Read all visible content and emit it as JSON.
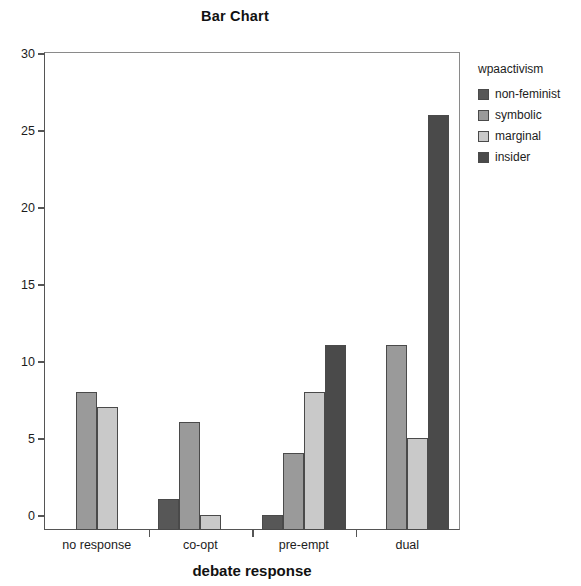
{
  "chart_data": {
    "type": "bar",
    "title": "Bar Chart",
    "xlabel": "debate response",
    "ylabel": "",
    "ylim": [
      0,
      31
    ],
    "grid": false,
    "legend_position": "right",
    "legend_title": "wpaactivism",
    "yticks": [
      0,
      5,
      10,
      15,
      20,
      25,
      30
    ],
    "ytick_labels": [
      "0",
      "5",
      "10",
      "15",
      "20",
      "25",
      "30"
    ],
    "categories": [
      "no response",
      "co-opt",
      "pre-empt",
      "dual"
    ],
    "series": [
      {
        "name": "non-feminist",
        "color": "#575757",
        "values": [
          0,
          2,
          1,
          0
        ]
      },
      {
        "name": "symbolic",
        "color": "#9a9a9a",
        "values": [
          9,
          7,
          5,
          12
        ]
      },
      {
        "name": "marginal",
        "color": "#c9c9c9",
        "values": [
          8,
          1,
          9,
          6
        ]
      },
      {
        "name": "insider",
        "color": "#4a4a4a",
        "values": [
          0,
          0,
          12,
          27
        ]
      }
    ]
  },
  "legend": {
    "title": "wpaactivism",
    "items": [
      {
        "label": "non-feminist"
      },
      {
        "label": "symbolic"
      },
      {
        "label": "marginal"
      },
      {
        "label": "insider"
      }
    ]
  }
}
